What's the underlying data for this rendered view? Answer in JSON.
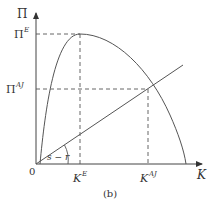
{
  "diagram": {
    "y_axis_label": "Π",
    "x_axis_label": "K",
    "origin_label": "0",
    "y_ticks": [
      {
        "base": "Π",
        "sup": "E"
      },
      {
        "base": "Π",
        "sup": "AJ"
      }
    ],
    "x_ticks": [
      {
        "base": "K",
        "sup": "E"
      },
      {
        "base": "K",
        "sup": "AJ"
      }
    ],
    "angle_label": "s − r",
    "caption": "(b)",
    "colors": {
      "axis": "#444444",
      "curve": "#555555",
      "dashed": "#555555"
    }
  }
}
